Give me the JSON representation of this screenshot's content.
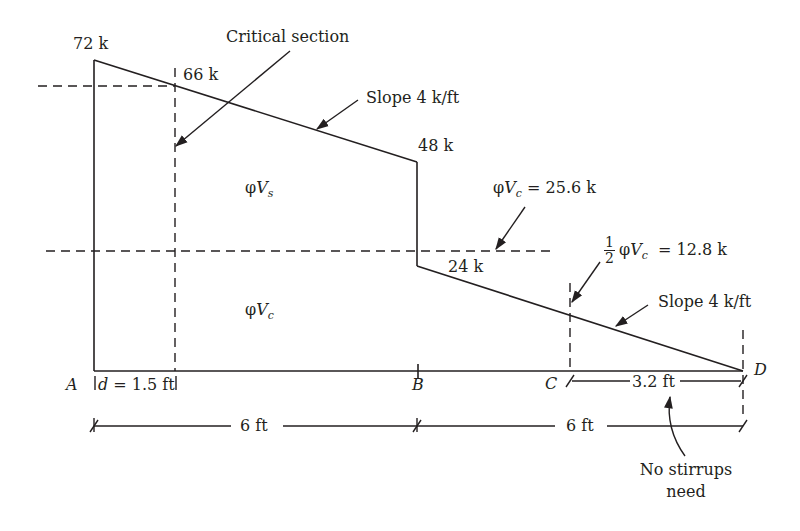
{
  "diagram": {
    "type": "shear force diagram",
    "line_color": "#231f20",
    "shear_values": {
      "at_A": "72 k",
      "at_critical_section": "66 k",
      "at_B_left": "48 k",
      "at_B_right": "24 k"
    },
    "annotations": {
      "critical_section": "Critical section",
      "slope_upper": "Slope 4 k/ft",
      "slope_lower": "Slope 4 k/ft",
      "phi_vc": {
        "phi": "φ",
        "V": "V",
        "sub": "c",
        "rest": " = 25.6 k"
      },
      "half_phi_vc": {
        "num": "1",
        "den": "2",
        "phi": "φ",
        "V": "V",
        "sub": "c",
        "rest": " = 12.8 k"
      },
      "phi_vs_region": {
        "phi": "φ",
        "V": "V",
        "sub": "s"
      },
      "phi_vc_region": {
        "phi": "φ",
        "V": "V",
        "sub": "c"
      },
      "no_stirrups_line1": "No stirrups",
      "no_stirrups_line2": "need"
    },
    "points": {
      "A": "A",
      "B": "B",
      "C": "C",
      "D": "D"
    },
    "dimensions": {
      "d": "d",
      "d_value": " = 1.5 ft",
      "span_AB": "6 ft",
      "span_BD": "6 ft",
      "span_CD": "3.2 ft"
    }
  }
}
